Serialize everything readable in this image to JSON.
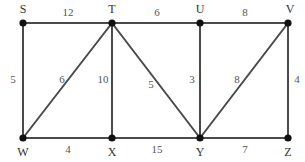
{
  "figure": {
    "type": "weighted-undirected-graph",
    "background_color": "#ffffff",
    "edge_color": "#4a4a4a",
    "node_color": "#111111",
    "label_color": "#333333",
    "weight_color": "#555555",
    "width": 305,
    "height": 162
  },
  "chart_data": {
    "type": "diagram",
    "title": "",
    "xlabel": "",
    "ylabel": "",
    "grid": false,
    "legend": "none",
    "graph_type": "weighted undirected graph",
    "node_count": 8,
    "edge_count": 13,
    "nodes": [
      {
        "id": "S",
        "label": "S",
        "x": 23,
        "y": 23,
        "label_x": 23,
        "label_y": 10
      },
      {
        "id": "T",
        "label": "T",
        "x": 112,
        "y": 23,
        "label_x": 112,
        "label_y": 10
      },
      {
        "id": "U",
        "label": "U",
        "x": 200,
        "y": 23,
        "label_x": 200,
        "label_y": 10
      },
      {
        "id": "V",
        "label": "V",
        "x": 288,
        "y": 23,
        "label_x": 290,
        "label_y": 10
      },
      {
        "id": "W",
        "label": "W",
        "x": 23,
        "y": 138,
        "label_x": 23,
        "label_y": 153
      },
      {
        "id": "X",
        "label": "X",
        "x": 112,
        "y": 138,
        "label_x": 112,
        "label_y": 153
      },
      {
        "id": "Y",
        "label": "Y",
        "x": 200,
        "y": 138,
        "label_x": 200,
        "label_y": 153
      },
      {
        "id": "Z",
        "label": "Z",
        "x": 288,
        "y": 138,
        "label_x": 288,
        "label_y": 153
      }
    ],
    "edges": [
      {
        "from": "S",
        "to": "T",
        "weight": 12,
        "label": "12",
        "label_x": 68,
        "label_y": 13
      },
      {
        "from": "T",
        "to": "U",
        "weight": 6,
        "label": "6",
        "label_x": 157,
        "label_y": 13
      },
      {
        "from": "U",
        "to": "V",
        "weight": 8,
        "label": "8",
        "label_x": 245,
        "label_y": 13
      },
      {
        "from": "S",
        "to": "W",
        "weight": 5,
        "label": "5",
        "label_x": 13,
        "label_y": 80
      },
      {
        "from": "T",
        "to": "W",
        "weight": 6,
        "label": "6",
        "label_x": 62,
        "label_y": 80
      },
      {
        "from": "T",
        "to": "X",
        "weight": 10,
        "label": "10",
        "label_x": 103,
        "label_y": 80
      },
      {
        "from": "T",
        "to": "Y",
        "weight": 5,
        "label": "5",
        "label_x": 151,
        "label_y": 85
      },
      {
        "from": "U",
        "to": "Y",
        "weight": 3,
        "label": "3",
        "label_x": 192,
        "label_y": 80
      },
      {
        "from": "V",
        "to": "Y",
        "weight": 8,
        "label": "8",
        "label_x": 237,
        "label_y": 80
      },
      {
        "from": "V",
        "to": "Z",
        "weight": 4,
        "label": "4",
        "label_x": 297,
        "label_y": 80
      },
      {
        "from": "W",
        "to": "X",
        "weight": 4,
        "label": "4",
        "label_x": 68,
        "label_y": 150
      },
      {
        "from": "X",
        "to": "Y",
        "weight": 15,
        "label": "15",
        "label_x": 157,
        "label_y": 150
      },
      {
        "from": "Y",
        "to": "Z",
        "weight": 7,
        "label": "7",
        "label_x": 245,
        "label_y": 150
      }
    ]
  }
}
